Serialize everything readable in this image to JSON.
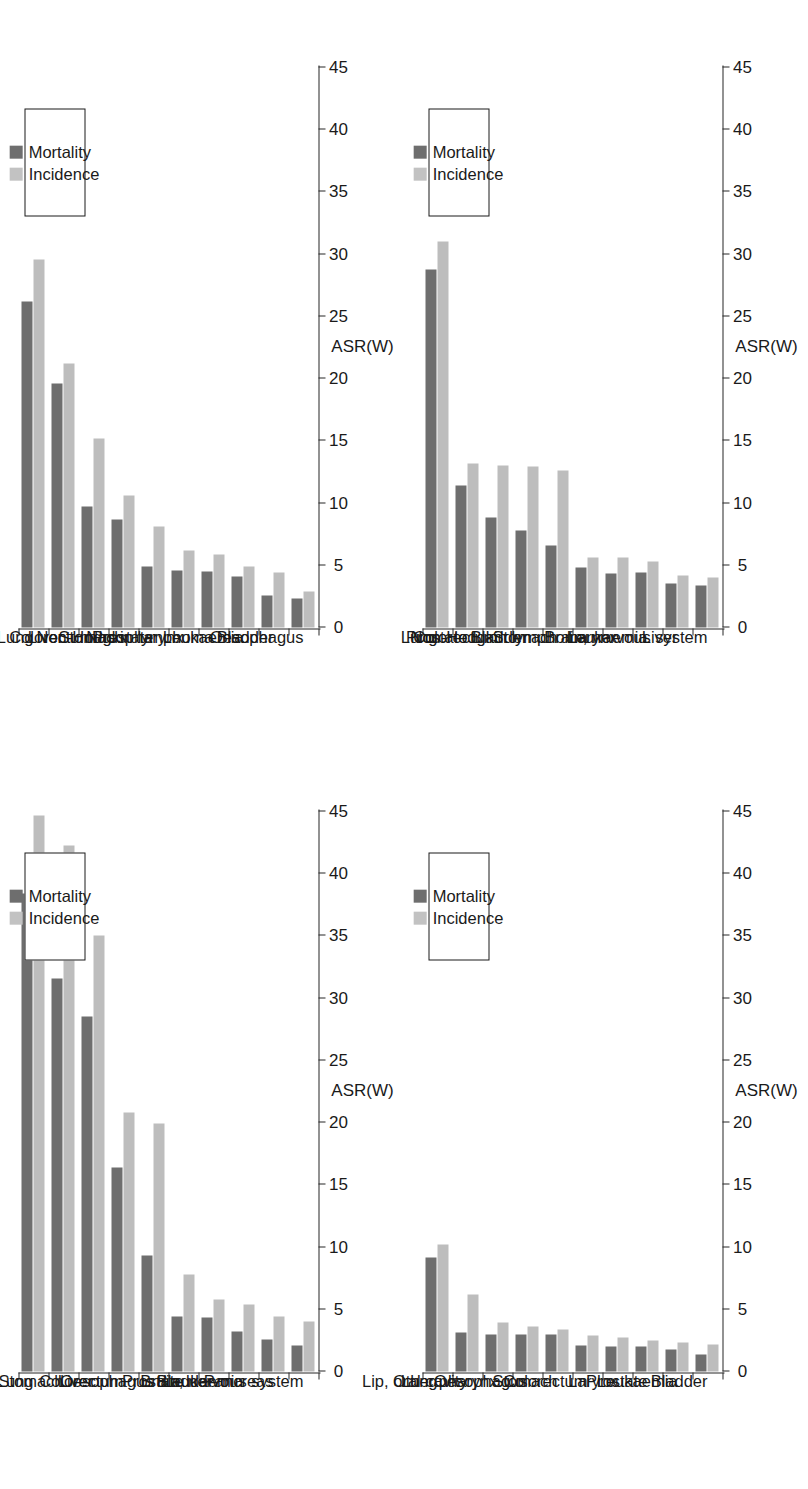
{
  "figure": {
    "panel_count": 4,
    "orientation": "rotated-90",
    "series_colors": {
      "mortality": "#6e6e6e",
      "incidence": "#c2c2c2"
    }
  },
  "legend": {
    "mortality_label": "Mortality",
    "incidence_label": "Incidence"
  },
  "axis": {
    "title": "ASR(W)",
    "ticks": [
      "0",
      "5",
      "10",
      "15",
      "20",
      "25",
      "30",
      "35",
      "40",
      "45"
    ]
  },
  "chart_data": [
    {
      "id": "panel-top-left",
      "type": "bar",
      "orientation": "horizontal",
      "title": "",
      "xlabel": "ASR(W)",
      "ylabel": "",
      "xlim": [
        0,
        45
      ],
      "grid": false,
      "legend_position": "inside-right",
      "categories": [
        "Lung",
        "Liver",
        "Colorectum",
        "Stomach",
        "Prostate",
        "Nasopharynx",
        "Non-Hodgkin lymphoma",
        "Leukaemia",
        "Bladder",
        "Oesophagus"
      ],
      "series": [
        {
          "name": "Mortality",
          "values": [
            26.2,
            19.6,
            9.7,
            8.7,
            4.9,
            4.6,
            4.5,
            4.1,
            2.6,
            2.3
          ]
        },
        {
          "name": "Incidence",
          "values": [
            29.6,
            21.2,
            15.2,
            10.6,
            8.1,
            6.2,
            5.9,
            4.9,
            4.4,
            2.9
          ]
        }
      ]
    },
    {
      "id": "panel-top-right",
      "type": "bar",
      "orientation": "horizontal",
      "title": "",
      "xlabel": "ASR(W)",
      "ylabel": "",
      "xlim": [
        0,
        45
      ],
      "grid": false,
      "legend_position": "inside-right",
      "categories": [
        "Lung",
        "Prostate",
        "Colorectum",
        "Bladder",
        "Stomach",
        "Non-Hodgkin lymphoma",
        "Larynx",
        "Leukaemia",
        "Liver",
        "Brain, nervous system"
      ],
      "series": [
        {
          "name": "Mortality",
          "values": [
            28.8,
            11.4,
            8.8,
            7.8,
            6.6,
            4.8,
            4.3,
            4.4,
            3.5,
            3.4
          ]
        },
        {
          "name": "Incidence",
          "values": [
            31.0,
            13.2,
            13.0,
            12.9,
            12.6,
            5.6,
            5.6,
            5.3,
            4.2,
            4.0
          ]
        }
      ]
    },
    {
      "id": "panel-bottom-left",
      "type": "bar",
      "orientation": "horizontal",
      "title": "",
      "xlabel": "ASR(W)",
      "ylabel": "",
      "xlim": [
        0,
        45
      ],
      "grid": false,
      "legend_position": "inside-right",
      "categories": [
        "Lung",
        "Stomach",
        "Liver",
        "Colorectum",
        "Oesophagus",
        "Prostate",
        "Bladder",
        "Leukaemia",
        "Pancreas",
        "Brain, nervous system"
      ],
      "series": [
        {
          "name": "Mortality",
          "values": [
            38.4,
            31.6,
            28.5,
            16.4,
            9.3,
            4.4,
            4.3,
            3.2,
            2.6,
            2.1
          ]
        },
        {
          "name": "Incidence",
          "values": [
            44.7,
            42.3,
            35.0,
            20.8,
            19.9,
            7.8,
            5.8,
            5.4,
            4.4,
            4.0
          ]
        }
      ]
    },
    {
      "id": "panel-bottom-right",
      "type": "bar",
      "orientation": "horizontal",
      "title": "",
      "xlabel": "ASR(W)",
      "ylabel": "",
      "xlim": [
        0,
        45
      ],
      "grid": false,
      "legend_position": "inside-right",
      "categories": [
        "Lung",
        "Lip, oral cavity",
        "Other pharynx",
        "Oesophagus",
        "Stomach",
        "Colorectum",
        "Larynx",
        "Prostate",
        "Leukaemia",
        "Bladder"
      ],
      "series": [
        {
          "name": "Mortality",
          "values": [
            9.2,
            3.1,
            3.0,
            3.0,
            3.0,
            2.1,
            2.0,
            2.0,
            1.8,
            1.4
          ]
        },
        {
          "name": "Incidence",
          "values": [
            10.2,
            6.2,
            3.9,
            3.6,
            3.4,
            2.9,
            2.7,
            2.5,
            2.3,
            2.2
          ]
        }
      ]
    }
  ]
}
